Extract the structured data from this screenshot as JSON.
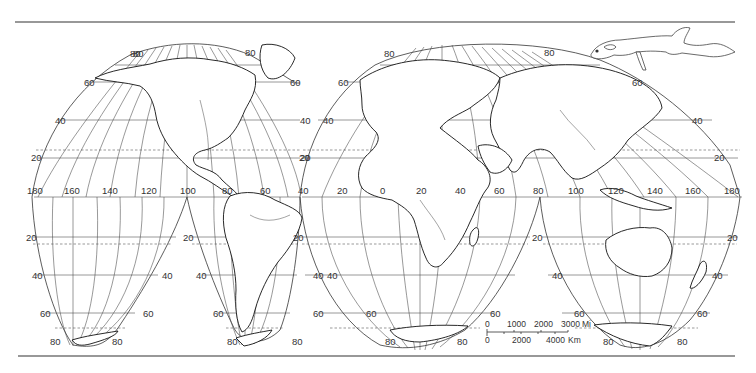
{
  "map": {
    "projection": "Interrupted homolosine (Goode) world outline map",
    "graticule_interval_degrees": 20,
    "latitude_labels": {
      "north": [
        "80",
        "60",
        "40",
        "20"
      ],
      "south": [
        "20",
        "40",
        "60",
        "80"
      ]
    },
    "longitude_labels_equator": [
      "180",
      "160",
      "140",
      "120",
      "100",
      "80",
      "60",
      "40",
      "20",
      "0",
      "20",
      "40",
      "60",
      "80",
      "100",
      "120",
      "140",
      "160",
      "180"
    ],
    "lobes": {
      "north": [
        {
          "name": "North America lobe",
          "lat_labels_left": [
            "80",
            "60",
            "40",
            "20"
          ],
          "lat_labels_right": [
            "80",
            "60",
            "40",
            "20"
          ]
        },
        {
          "name": "Eurasia / Africa lobe",
          "lat_labels_left": [
            "80",
            "60",
            "40",
            "20"
          ],
          "lat_labels_right": [
            "80",
            "60",
            "40",
            "20"
          ]
        }
      ],
      "south": [
        {
          "name": "Pacific lobe",
          "lat_labels": [
            "20",
            "40",
            "60",
            "80"
          ]
        },
        {
          "name": "South America lobe",
          "lat_labels": [
            "20",
            "40",
            "60",
            "80"
          ]
        },
        {
          "name": "Africa lobe",
          "lat_labels": [
            "20",
            "40",
            "60",
            "80"
          ]
        },
        {
          "name": "Australia lobe",
          "lat_labels": [
            "20",
            "40",
            "60",
            "80"
          ]
        }
      ]
    }
  },
  "scale_bar": {
    "miles": {
      "ticks": [
        "0",
        "1000",
        "2000",
        "3000"
      ],
      "unit": "Mi"
    },
    "kilometers": {
      "ticks": [
        "0",
        "2000",
        "4000"
      ],
      "unit": "Km"
    }
  },
  "illustration": {
    "name": "Mesosaurus-like reptile drawing"
  }
}
